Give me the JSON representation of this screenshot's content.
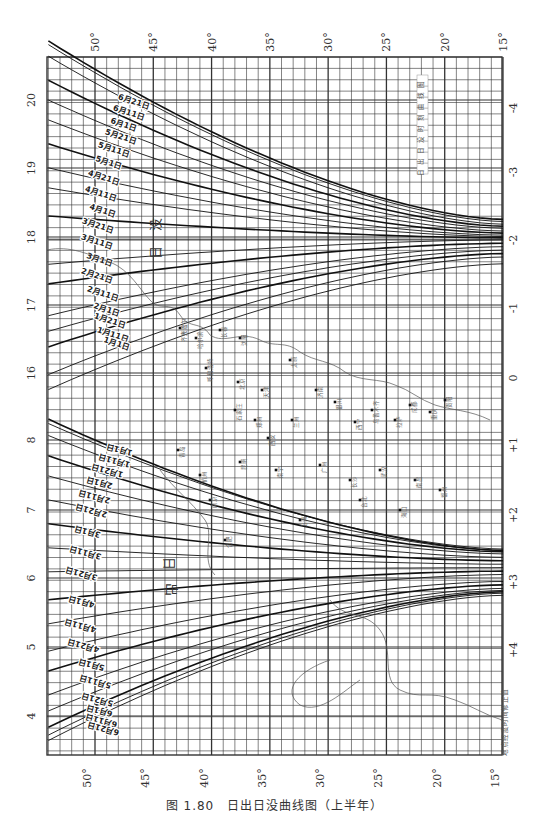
{
  "caption": "图 1.80　日出日没曲线图（上半年）",
  "chart_data": {
    "type": "line",
    "subtitle": "上半年",
    "xlabel": "纬度",
    "x_ticks": [
      "50°",
      "45°",
      "40°",
      "35°",
      "30°",
      "25°",
      "20°",
      "15°"
    ],
    "x_values": [
      50,
      45,
      40,
      35,
      30,
      25,
      20,
      15
    ],
    "left_axis_sunset_hours": [
      "20",
      "19",
      "18",
      "17",
      "16"
    ],
    "left_axis_sunrise_hours": [
      "8",
      "7",
      "6",
      "5",
      "4"
    ],
    "right_axis_label": "地点经度时间修正值",
    "right_axis_ticks": [
      "-4",
      "-3",
      "-2",
      "-1",
      "0",
      "+1",
      "+2",
      "+3",
      "+4"
    ],
    "region_labels": {
      "sunset": "日没",
      "sunrise": "日出"
    },
    "grid": true,
    "sunset_series": [
      {
        "name": "6月21日",
        "lat50": 20.45,
        "lat15": 18.25
      },
      {
        "name": "6月11日",
        "lat50": 20.4,
        "lat15": 18.22
      },
      {
        "name": "6月1日",
        "lat50": 20.25,
        "lat15": 18.18
      },
      {
        "name": "5月21日",
        "lat50": 19.95,
        "lat15": 18.15
      },
      {
        "name": "5月11日",
        "lat50": 19.7,
        "lat15": 18.12
      },
      {
        "name": "5月1日",
        "lat50": 19.45,
        "lat15": 18.08
      },
      {
        "name": "4月21日",
        "lat50": 19.15,
        "lat15": 18.05
      },
      {
        "name": "4月11日",
        "lat50": 18.85,
        "lat15": 18.02
      },
      {
        "name": "4月1日",
        "lat50": 18.6,
        "lat15": 18.0
      },
      {
        "name": "3月21日",
        "lat50": 18.25,
        "lat15": 17.98
      },
      {
        "name": "3月11日",
        "lat50": 17.95,
        "lat15": 17.95
      },
      {
        "name": "3月1日",
        "lat50": 17.65,
        "lat15": 17.95
      },
      {
        "name": "2月21日",
        "lat50": 17.4,
        "lat15": 17.9
      },
      {
        "name": "2月11日",
        "lat50": 17.0,
        "lat15": 17.85
      },
      {
        "name": "2月1日",
        "lat50": 16.8,
        "lat15": 17.8
      },
      {
        "name": "1月21日",
        "lat50": 16.6,
        "lat15": 17.75
      },
      {
        "name": "1月11日",
        "lat50": 16.25,
        "lat15": 17.7
      },
      {
        "name": "1月1日",
        "lat50": 16.05,
        "lat15": 17.6
      }
    ],
    "sunrise_series": [
      {
        "name": "1月1日",
        "lat50": 8.0,
        "lat15": 6.4
      },
      {
        "name": "1月11日",
        "lat50": 7.95,
        "lat15": 6.42
      },
      {
        "name": "1月21日",
        "lat50": 7.8,
        "lat15": 6.4
      },
      {
        "name": "2月1日",
        "lat50": 7.55,
        "lat15": 6.38
      },
      {
        "name": "2月11日",
        "lat50": 7.3,
        "lat15": 6.35
      },
      {
        "name": "2月21日",
        "lat50": 7.0,
        "lat15": 6.3
      },
      {
        "name": "3月1日",
        "lat50": 6.7,
        "lat15": 6.25
      },
      {
        "name": "3月11日",
        "lat50": 6.4,
        "lat15": 6.2
      },
      {
        "name": "3月21日",
        "lat50": 6.1,
        "lat15": 6.15
      },
      {
        "name": "4月1日",
        "lat50": 5.75,
        "lat15": 6.1
      },
      {
        "name": "4月11日",
        "lat50": 5.45,
        "lat15": 6.05
      },
      {
        "name": "4月21日",
        "lat50": 5.1,
        "lat15": 5.95
      },
      {
        "name": "5月1日",
        "lat50": 4.85,
        "lat15": 5.9
      },
      {
        "name": "5月11日",
        "lat50": 4.55,
        "lat15": 5.85
      },
      {
        "name": "5月21日",
        "lat50": 4.35,
        "lat15": 5.82
      },
      {
        "name": "6月1日",
        "lat50": 4.15,
        "lat15": 5.8
      },
      {
        "name": "6月11日",
        "lat50": 4.05,
        "lat15": 5.78
      },
      {
        "name": "6月21日",
        "lat50": 3.98,
        "lat15": 5.75
      }
    ],
    "cities_partial": [
      "齐齐哈尔",
      "哈尔滨",
      "长春",
      "沈阳",
      "呼和浩特",
      "北京",
      "天津",
      "太原",
      "济南",
      "石家庄",
      "郑州",
      "西安",
      "兰州",
      "银川",
      "西宁",
      "乌鲁木齐",
      "拉萨",
      "成都",
      "重庆",
      "贵阳",
      "昆明",
      "南宁",
      "广州",
      "长沙",
      "武汉",
      "南昌",
      "福州",
      "杭州",
      "南京",
      "合肥",
      "上海",
      "台北",
      "海口",
      "青岛",
      "大连"
    ]
  },
  "axes": {
    "top_lat": [
      "50°",
      "45°",
      "40°",
      "35°",
      "30°",
      "25°",
      "20°",
      "15°"
    ],
    "bottom_lat": [
      "50°",
      "45°",
      "40°",
      "35°",
      "30°",
      "25°",
      "20°",
      "15°"
    ],
    "left_hours": [
      "20",
      "19",
      "18",
      "17",
      "16",
      "8",
      "7",
      "6",
      "5",
      "4"
    ],
    "right_corr": [
      "-4",
      "-3",
      "-2",
      "-1",
      "0",
      "+1",
      "+2",
      "+3",
      "+4"
    ]
  },
  "labels": {
    "inner_title": "日出日没时刻曲线图",
    "correction_note": "地点经度时间修正值",
    "sunset_big_1": "没",
    "sunset_big_2": "日",
    "sunrise_big_1": "日",
    "sunrise_big_2": "出"
  }
}
